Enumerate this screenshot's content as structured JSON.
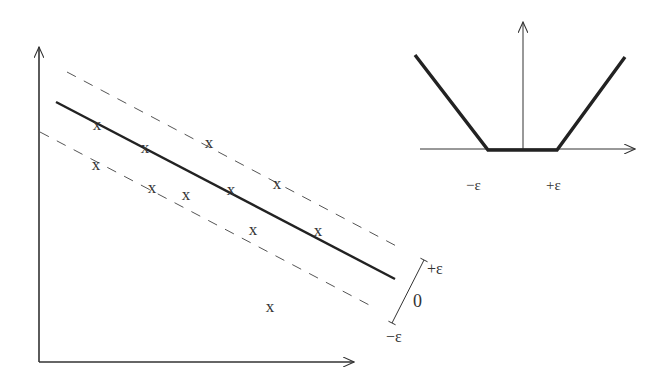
{
  "figure": {
    "colors": {
      "axis": "#333333",
      "regression_line": "#222222",
      "margin_line": "#555555",
      "loss_line": "#222222",
      "text": "#333333"
    },
    "main_plot": {
      "x_axis": {
        "x1": 39,
        "y1": 362,
        "x2": 354,
        "y2": 362
      },
      "y_axis": {
        "x1": 39,
        "y1": 362,
        "x2": 39,
        "y2": 47
      },
      "regression_line": {
        "x1": 56,
        "y1": 102,
        "x2": 395,
        "y2": 279
      },
      "upper_margin": {
        "x1": 67,
        "y1": 72,
        "x2": 402,
        "y2": 249
      },
      "lower_margin": {
        "x1": 40,
        "y1": 132,
        "x2": 373,
        "y2": 307
      },
      "marker_glyph": "x",
      "points": [
        {
          "x": 97,
          "y": 124
        },
        {
          "x": 145,
          "y": 147
        },
        {
          "x": 209,
          "y": 142
        },
        {
          "x": 96,
          "y": 164
        },
        {
          "x": 152,
          "y": 187
        },
        {
          "x": 186,
          "y": 194
        },
        {
          "x": 231,
          "y": 189
        },
        {
          "x": 277,
          "y": 183
        },
        {
          "x": 253,
          "y": 229
        },
        {
          "x": 318,
          "y": 230
        },
        {
          "x": 270,
          "y": 306
        }
      ],
      "tube_bracket": {
        "line": {
          "x1": 392,
          "y1": 323,
          "x2": 424,
          "y2": 260
        },
        "labels": {
          "plus_eps": "+ε",
          "zero": "0",
          "minus_eps": "−ε"
        }
      }
    },
    "inset_loss": {
      "x_axis": {
        "x1": 420,
        "y1": 149,
        "x2": 635,
        "y2": 149
      },
      "y_axis": {
        "x1": 523,
        "y1": 149,
        "x2": 523,
        "y2": 22
      },
      "loss_curve": [
        [
          415,
          55
        ],
        [
          488,
          150
        ],
        [
          557,
          150
        ],
        [
          625,
          57
        ]
      ],
      "tick_labels": {
        "minus_eps": "−ε",
        "plus_eps": "+ε"
      }
    }
  }
}
